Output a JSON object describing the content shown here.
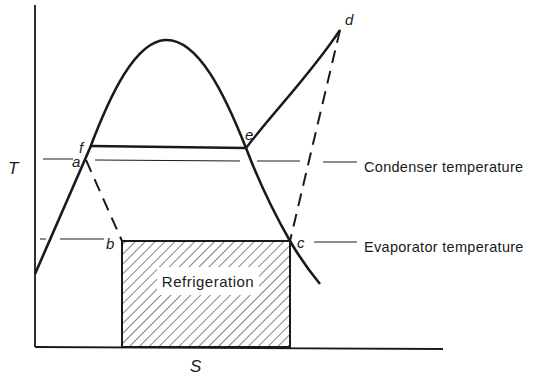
{
  "figure": {
    "type": "T-S diagram (vapor-compression refrigeration cycle)",
    "axes": {
      "y_label": "T",
      "x_label": "S"
    },
    "points": {
      "a": "a",
      "b": "b",
      "c": "c",
      "d": "d",
      "e": "e",
      "f": "f"
    },
    "annotations": {
      "condenser": "Condenser temperature",
      "evaporator": "Evaporator temperature"
    },
    "shaded_region_label": "Refrigeration",
    "colors": {
      "line": "#1a1a1a",
      "background": "#ffffff"
    }
  }
}
